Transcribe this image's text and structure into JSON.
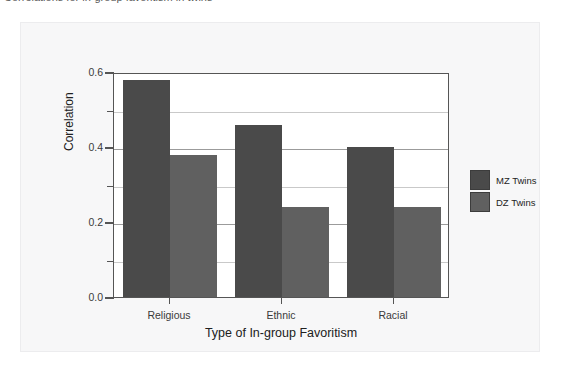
{
  "caption": {
    "text": "Correlations for in-group favoritism in twins"
  },
  "chart_data": {
    "type": "bar",
    "title": "",
    "categories": [
      "Religious",
      "Ethnic",
      "Racial"
    ],
    "series": [
      {
        "name": "MZ Twins",
        "values": [
          0.58,
          0.46,
          0.4
        ],
        "color": "#4a4a4a"
      },
      {
        "name": "DZ Twins",
        "values": [
          0.38,
          0.24,
          0.24
        ],
        "color": "#606060"
      }
    ],
    "xlabel": "Type of In-group Favoritism",
    "ylabel": "Correlation",
    "ylim": [
      0.0,
      0.6
    ],
    "yticks": [
      "0.0",
      "0.2",
      "0.4",
      "0.6"
    ],
    "ytick_values": [
      0.0,
      0.2,
      0.4,
      0.6
    ],
    "minor_gridlines": [
      0.1,
      0.3,
      0.5
    ],
    "grid": true,
    "legend_position": "right"
  },
  "legend": {
    "items": [
      {
        "label": "MZ Twins"
      },
      {
        "label": "DZ Twins"
      }
    ]
  }
}
